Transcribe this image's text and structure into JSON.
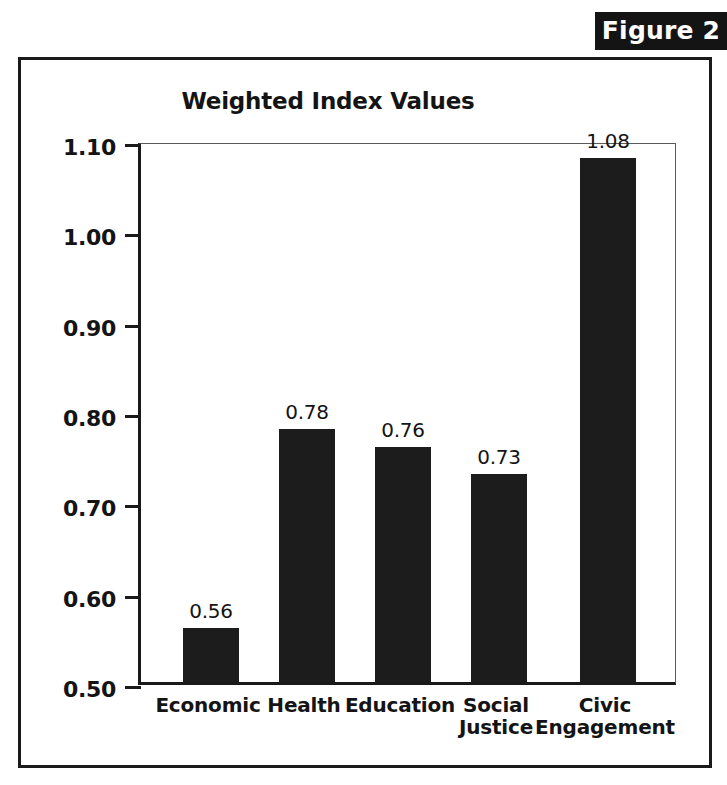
{
  "figure": {
    "banner_label": "Figure 2"
  },
  "chart_data": {
    "type": "bar",
    "title": "Weighted Index Values",
    "xlabel": "",
    "ylabel": "",
    "ylim": [
      0.5,
      1.1
    ],
    "ytick_labels": [
      "1.10",
      "1.00",
      "0.90",
      "0.80",
      "0.70",
      "0.60",
      "0.50"
    ],
    "yticks": [
      1.1,
      1.0,
      0.9,
      0.8,
      0.7,
      0.6,
      0.5
    ],
    "grid": false,
    "legend": null,
    "bar_color": "#1c1c1c",
    "categories": [
      "Economic",
      "Health",
      "Education",
      "Social Justice",
      "Civic Engagement"
    ],
    "category_lines": [
      [
        "Economic"
      ],
      [
        "Health"
      ],
      [
        "Education"
      ],
      [
        "Social",
        "Justice"
      ],
      [
        "Civic",
        "Engagement"
      ]
    ],
    "values": [
      0.56,
      0.78,
      0.76,
      0.73,
      1.08
    ],
    "value_labels": [
      "0.56",
      "0.78",
      "0.76",
      "0.73",
      "1.08"
    ]
  }
}
